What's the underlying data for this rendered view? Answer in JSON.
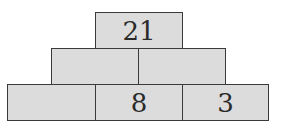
{
  "pyramid": {
    "rows": [
      {
        "cells": [
          {
            "value": "21"
          }
        ]
      },
      {
        "cells": [
          {
            "value": ""
          },
          {
            "value": ""
          }
        ]
      },
      {
        "cells": [
          {
            "value": ""
          },
          {
            "value": "8"
          },
          {
            "value": "3"
          }
        ]
      }
    ]
  },
  "colors": {
    "cell_fill": "#dcdcdc",
    "border": "#3a3a3a",
    "text": "#2a2a2a"
  }
}
